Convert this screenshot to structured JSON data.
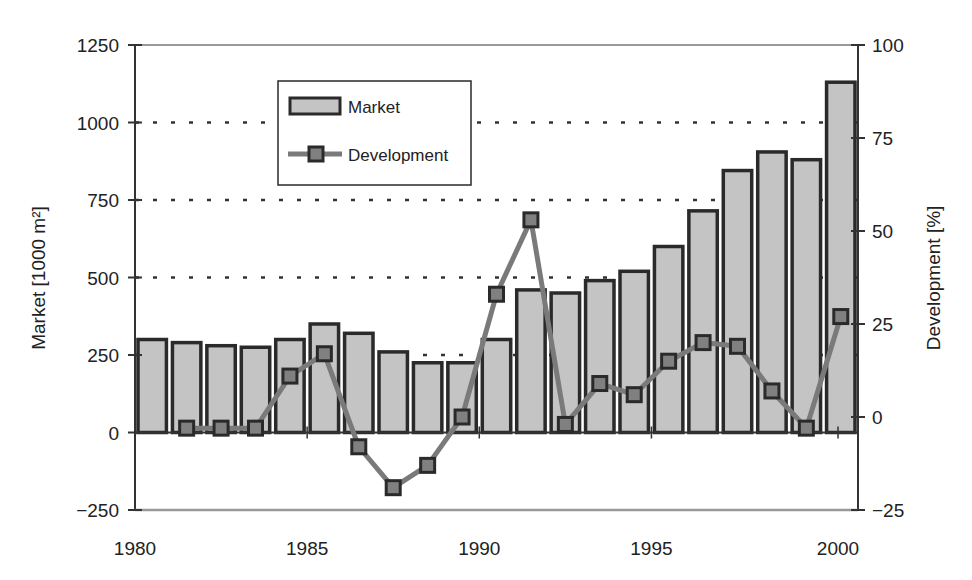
{
  "chart_data": {
    "type": "bar+line",
    "title": "",
    "x": [
      1980,
      1981,
      1982,
      1983,
      1984,
      1985,
      1986,
      1987,
      1988,
      1989,
      1990,
      1991,
      1992,
      1993,
      1994,
      1995,
      1996,
      1997,
      1998,
      1999,
      2000
    ],
    "xticks": [
      "1980",
      "1985",
      "1990",
      "1995",
      "2000"
    ],
    "xlabel": "",
    "series": [
      {
        "name": "Market",
        "type": "bar",
        "axis": "left",
        "values": [
          300,
          290,
          280,
          275,
          300,
          350,
          320,
          260,
          225,
          225,
          300,
          460,
          450,
          490,
          520,
          600,
          715,
          845,
          905,
          880,
          1130
        ]
      },
      {
        "name": "Development",
        "type": "line",
        "axis": "right",
        "values": [
          null,
          -3,
          -3,
          -3,
          11,
          17,
          -8,
          -19,
          -13,
          0,
          33,
          53,
          -2,
          9,
          6,
          15,
          20,
          19,
          7,
          -3,
          27
        ]
      }
    ],
    "ylabel": "Market [1000 m²]",
    "ylim": [
      -250,
      1250
    ],
    "yticks": [
      -250,
      0,
      250,
      500,
      750,
      1000,
      1250
    ],
    "ytick_labels": [
      "−250",
      "0",
      "250",
      "500",
      "750",
      "1000",
      "1250"
    ],
    "y2label": "Development [%]",
    "y2lim": [
      -25,
      100
    ],
    "y2ticks": [
      -25,
      0,
      25,
      50,
      75,
      100
    ],
    "y2tick_labels": [
      "−25",
      "0",
      "25",
      "50",
      "75",
      "100"
    ],
    "gridlines_dotted_at": [
      250,
      500,
      750,
      1000
    ],
    "legend": {
      "position": "upper-left-inside",
      "entries": [
        "Market",
        "Development"
      ]
    },
    "colors": {
      "bar_fill": "#c4c4c4",
      "bar_edge": "#2a2a2a",
      "line": "#7a7a7a",
      "marker_fill": "#808080",
      "marker_edge": "#2a2a2a",
      "axis": "#333333",
      "grid": "#333333"
    }
  }
}
